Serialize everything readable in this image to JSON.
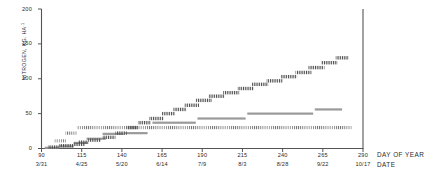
{
  "axes": {
    "y_title": "NITROGEN, KG. HA",
    "y_title_sup": "-1",
    "x_title_line1": "DAY OF YEAR",
    "x_title_line2": "DATE",
    "y_ticks": [
      "200",
      "150",
      "100",
      "50",
      "0"
    ],
    "x_ticks": [
      "90",
      "115",
      "140",
      "165",
      "190",
      "215",
      "240",
      "265",
      "290"
    ],
    "x_dates": [
      "3/31",
      "4/25",
      "5/20",
      "6/14",
      "7/9",
      "8/3",
      "8/28",
      "9/22",
      "10/17"
    ]
  },
  "colors": {
    "axis": "#555555",
    "text": "#2b2b2b",
    "series_hatched": "#4a4a4a",
    "series_dotted": "#6b6b6b",
    "series_gray": "#9a9a9a"
  },
  "chart_data": {
    "type": "line",
    "title": "",
    "xlabel": "DAY OF YEAR",
    "ylabel": "NITROGEN, KG. HA-1",
    "xlim": [
      90,
      290
    ],
    "ylim": [
      0,
      200
    ],
    "yticks": [
      0,
      50,
      100,
      150,
      200
    ],
    "xticks": [
      90,
      115,
      140,
      165,
      190,
      215,
      240,
      265,
      290
    ],
    "xtick_dates": [
      "3/31",
      "4/25",
      "5/20",
      "6/14",
      "7/9",
      "8/3",
      "8/28",
      "9/22",
      "10/17"
    ],
    "grid": false,
    "legend": "none",
    "series": [
      {
        "name": "cumulative-step-hatched",
        "style": "hatched-step",
        "steps": [
          {
            "x0": 94,
            "x1": 101,
            "y": 2
          },
          {
            "x0": 101,
            "x1": 110,
            "y": 4
          },
          {
            "x0": 110,
            "x1": 117,
            "y": 6
          },
          {
            "x0": 113,
            "x1": 119,
            "y": 9
          },
          {
            "x0": 119,
            "x1": 127,
            "y": 12
          },
          {
            "x0": 128,
            "x1": 136,
            "y": 16
          },
          {
            "x0": 136,
            "x1": 143,
            "y": 22
          },
          {
            "x0": 143,
            "x1": 150,
            "y": 30
          },
          {
            "x0": 150,
            "x1": 158,
            "y": 37
          },
          {
            "x0": 157,
            "x1": 166,
            "y": 43
          },
          {
            "x0": 165,
            "x1": 173,
            "y": 50
          },
          {
            "x0": 172,
            "x1": 180,
            "y": 56
          },
          {
            "x0": 179,
            "x1": 188,
            "y": 62
          },
          {
            "x0": 186,
            "x1": 196,
            "y": 69
          },
          {
            "x0": 194,
            "x1": 204,
            "y": 75
          },
          {
            "x0": 203,
            "x1": 213,
            "y": 80
          },
          {
            "x0": 212,
            "x1": 222,
            "y": 86
          },
          {
            "x0": 221,
            "x1": 231,
            "y": 92
          },
          {
            "x0": 230,
            "x1": 240,
            "y": 97
          },
          {
            "x0": 239,
            "x1": 249,
            "y": 103
          },
          {
            "x0": 248,
            "x1": 258,
            "y": 109
          },
          {
            "x0": 256,
            "x1": 266,
            "y": 116
          },
          {
            "x0": 264,
            "x1": 274,
            "y": 123
          },
          {
            "x0": 273,
            "x1": 281,
            "y": 130
          }
        ]
      },
      {
        "name": "baseline-dotted",
        "style": "dotted-horizontal",
        "steps": [
          {
            "x0": 98,
            "x1": 105,
            "y": 11
          },
          {
            "x0": 105,
            "x1": 112,
            "y": 22
          },
          {
            "x0": 112,
            "x1": 283,
            "y": 30
          }
        ]
      },
      {
        "name": "gray-step",
        "style": "thick-gray-step",
        "steps": [
          {
            "x0": 92,
            "x1": 101,
            "y": 1
          },
          {
            "x0": 101,
            "x1": 110,
            "y": 3
          },
          {
            "x0": 110,
            "x1": 119,
            "y": 8
          },
          {
            "x0": 118,
            "x1": 130,
            "y": 14
          },
          {
            "x0": 128,
            "x1": 141,
            "y": 21
          },
          {
            "x0": 142,
            "x1": 156,
            "y": 22
          },
          {
            "x0": 159,
            "x1": 186,
            "y": 37
          },
          {
            "x0": 187,
            "x1": 217,
            "y": 43
          },
          {
            "x0": 218,
            "x1": 259,
            "y": 50
          },
          {
            "x0": 260,
            "x1": 277,
            "y": 56
          }
        ]
      }
    ]
  }
}
